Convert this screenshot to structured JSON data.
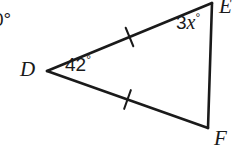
{
  "figure": {
    "kind": "geometry-triangle-diagram",
    "background_color": "#ffffff",
    "stroke_color": "#1a1a1a",
    "text_color": "#1a1a1a",
    "stroke_width": 2.6,
    "tick_stroke_width": 2.0
  },
  "triangle": {
    "name": "DEF",
    "vertices": [
      {
        "id": "D",
        "label": "D",
        "x": 47,
        "y": 71
      },
      {
        "id": "E",
        "label": "E",
        "x": 212,
        "y": 3
      },
      {
        "id": "F",
        "label": "F",
        "x": 208,
        "y": 128
      }
    ],
    "sides": [
      {
        "id": "DE",
        "from": "D",
        "to": "E",
        "tick_marks": 1
      },
      {
        "id": "DF",
        "from": "D",
        "to": "F",
        "tick_marks": 1
      },
      {
        "id": "EF",
        "from": "E",
        "to": "F",
        "tick_marks": 0
      }
    ]
  },
  "labels": {
    "partial_angle": {
      "text": "0°",
      "note": "cropped at left edge"
    },
    "vertex_d": "D",
    "vertex_e": "E",
    "vertex_f": "F",
    "angle_d": {
      "value": "42",
      "degree": "°"
    },
    "angle_e": {
      "coefficient": "3",
      "variable": "x",
      "degree": "°"
    }
  }
}
